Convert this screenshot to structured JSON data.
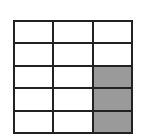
{
  "diagram": {
    "type": "fraction-grid",
    "rows": 5,
    "cols": 3,
    "shaded_color": "#9a9a9a",
    "cells": [
      [
        false,
        false,
        false
      ],
      [
        false,
        false,
        false
      ],
      [
        false,
        false,
        true
      ],
      [
        false,
        false,
        true
      ],
      [
        false,
        false,
        true
      ]
    ],
    "shaded_count": 3,
    "total_count": 15
  }
}
